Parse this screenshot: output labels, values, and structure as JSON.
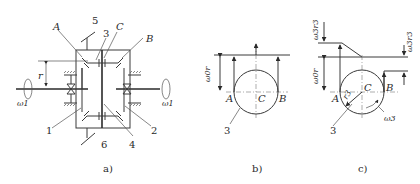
{
  "figure": {
    "panels": [
      {
        "id": "a",
        "caption": "a)",
        "labels": {
          "A": "A",
          "B": "B",
          "C": "C",
          "r": "r",
          "omega_left": "ω1",
          "omega_right": "ω1",
          "parts": [
            "1",
            "2",
            "3",
            "4",
            "5",
            "6"
          ]
        }
      },
      {
        "id": "b",
        "caption": "b)",
        "labels": {
          "A": "A",
          "B": "B",
          "C": "C",
          "velocity": "ω0r",
          "part": "3"
        }
      },
      {
        "id": "c",
        "caption": "c)",
        "labels": {
          "A": "A",
          "B": "B",
          "C": "C",
          "velocity_center": "ω0r",
          "velocity_top": "ω3r3",
          "velocity_right": "ω3r3",
          "radius": "r3",
          "angular": "ω3",
          "part": "3"
        }
      }
    ]
  }
}
